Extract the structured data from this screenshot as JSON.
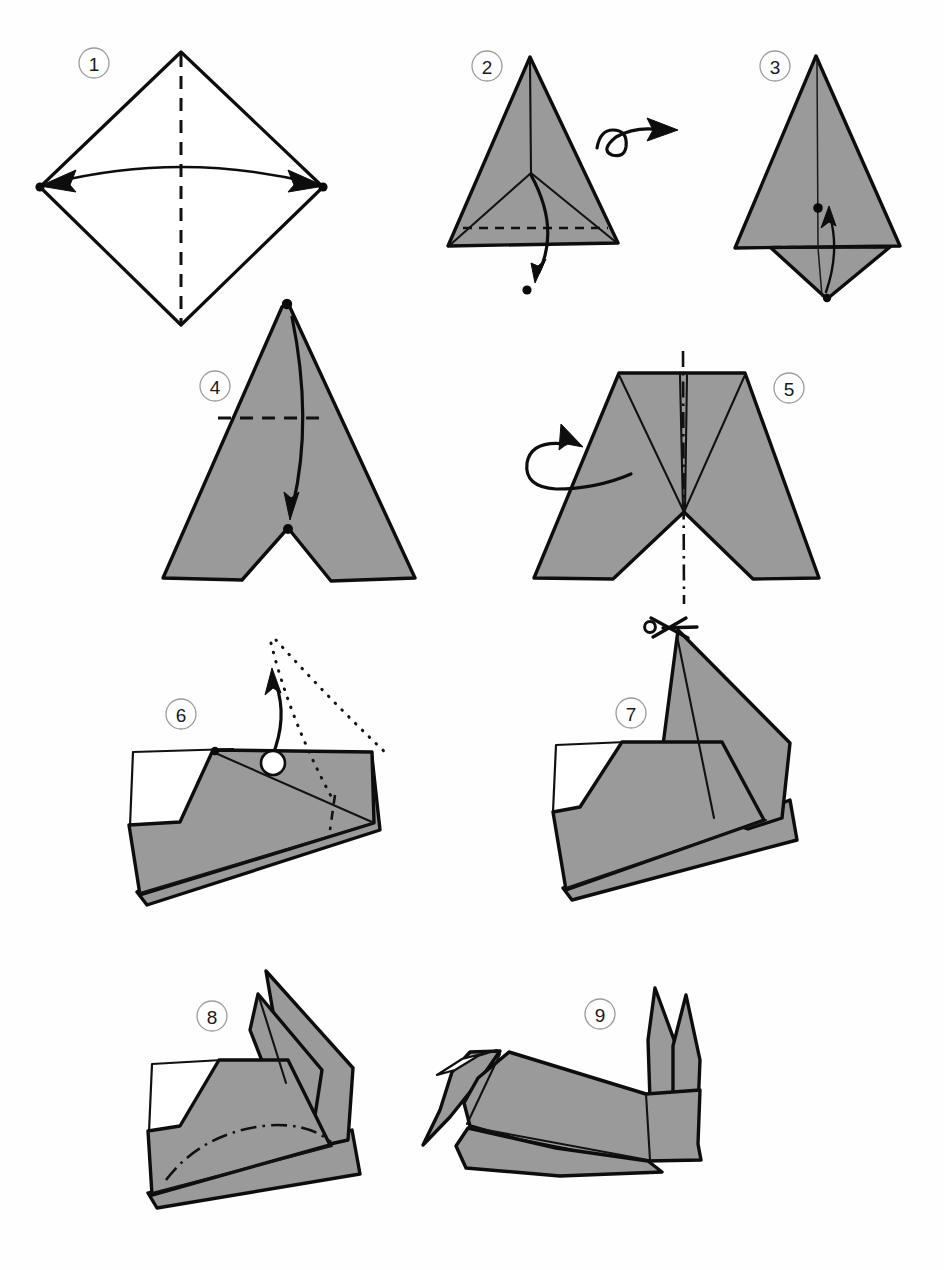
{
  "document": {
    "title": "Origami folding diagram",
    "subject": "rabbit",
    "page_background": "#ffffff",
    "step_count": 9
  },
  "palette": {
    "paper_front_grey": "#9a9a9a",
    "paper_back_white": "#ffffff",
    "outline": "#0d0d0d",
    "crease_line": "#121212",
    "step_circle_stroke": "#9b9b9b",
    "step_number_text": "#1a1a1a"
  },
  "legend": {
    "valley_fold": "dashed line",
    "mountain_fold": "dash-dot line",
    "hidden_edge": "dotted line",
    "fold_direction": "solid arrow",
    "turn_over": "looped arrow",
    "cut_here": "scissors"
  },
  "steps": [
    {
      "number": "1",
      "label_x": 94,
      "label_y": 63,
      "shape": "diamond",
      "description": "Square sheet rotated to a diamond. Fold left point to right point along the vertical centre crease, then unfold.",
      "symbols": [
        "valley-fold-vertical",
        "double-headed-crease-arrow",
        "vertex-dot-left",
        "vertex-dot-right"
      ]
    },
    {
      "number": "2",
      "label_x": 487,
      "label_y": 66,
      "shape": "triangle-grey",
      "description": "Grey triangle with centre crease and radiating creases. Valley fold the lower band down and out, then turn the model over.",
      "symbols": [
        "valley-fold-horizontal",
        "arrow-down-out",
        "turn-over-loop",
        "target-dot"
      ]
    },
    {
      "number": "3",
      "label_x": 775,
      "label_y": 66,
      "shape": "triangle-grey-with-flap",
      "description": "Fold the small bottom triangular flap upwards to the marked dot on the centre line.",
      "symbols": [
        "valley-fold-horizontal",
        "arrow-up",
        "target-dot",
        "tip-dot"
      ]
    },
    {
      "number": "4",
      "label_x": 215,
      "label_y": 386,
      "shape": "tall-triangle-notch",
      "description": "Tall grey triangle with a white notch at the base. Bring the top point down to the inner dot, folding along the dashed line.",
      "symbols": [
        "valley-fold-horizontal",
        "long-curved-arrow-down",
        "apex-dot",
        "target-dot"
      ]
    },
    {
      "number": "5",
      "label_x": 789,
      "label_y": 388,
      "shape": "trapezoid-v-creases",
      "description": "Blunt trapezoid with a V of creases and a white triangle notch. Mountain fold the model in half along the vertical centre line, folding the near side behind.",
      "symbols": [
        "mountain-fold-vertical",
        "fold-behind-loop-arrow"
      ]
    },
    {
      "number": "6",
      "label_x": 181,
      "label_y": 714,
      "shape": "folded-flat-body",
      "description": "The folded body seen from the side. Pull the inner point up along the dotted outline to form the neck, using an inside reverse fold.",
      "symbols": [
        "hidden-dotted-outline",
        "curved-arrow-up",
        "pivot-circle",
        "valley-fold-short"
      ]
    },
    {
      "number": "7",
      "label_x": 631,
      "label_y": 713,
      "shape": "body-with-neck",
      "description": "The neck is now raised. Cut the tip of the neck down the middle to make the two ears.",
      "symbols": [
        "scissors",
        "cut-line"
      ]
    },
    {
      "number": "8",
      "label_x": 212,
      "label_y": 1016,
      "shape": "body-with-split-ears",
      "description": "The tip is split into two ears. Mountain fold the lower body along the curved dash-dot line to shape and round the back.",
      "symbols": [
        "mountain-fold-curved",
        "split-ear-points"
      ]
    },
    {
      "number": "9",
      "label_x": 600,
      "label_y": 1014,
      "shape": "finished-rabbit",
      "description": "The finished rabbit, shaped and rounded, with two upright ears.",
      "symbols": [
        "finished-model"
      ]
    }
  ]
}
